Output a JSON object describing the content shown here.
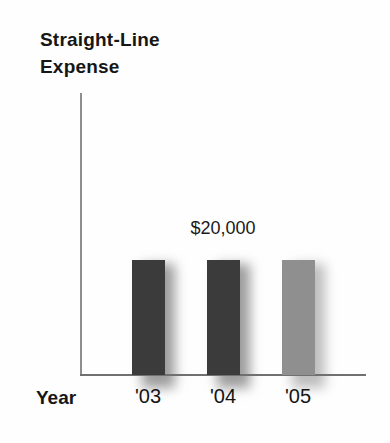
{
  "chart_data": {
    "type": "bar",
    "title": "Straight-Line Expense",
    "title_lines": [
      "Straight-Line",
      "Expense"
    ],
    "xlabel": "Year",
    "ylabel": "",
    "categories": [
      "'03",
      "'04",
      "'05"
    ],
    "values": [
      20000,
      20000,
      20000
    ],
    "annotation": {
      "text": "$20,000",
      "bar_index": 1
    },
    "bar_colors": [
      "#3b3b3b",
      "#3b3b3b",
      "#8f8f8f"
    ],
    "shadow_colors": [
      "#9c9c9c",
      "#9c9c9c",
      "#bdbdbd"
    ],
    "axis_color_y": "#8e8e8e",
    "axis_color_x": "#707070",
    "ylim": [
      0,
      20000
    ],
    "grid": false,
    "legend": false
  }
}
